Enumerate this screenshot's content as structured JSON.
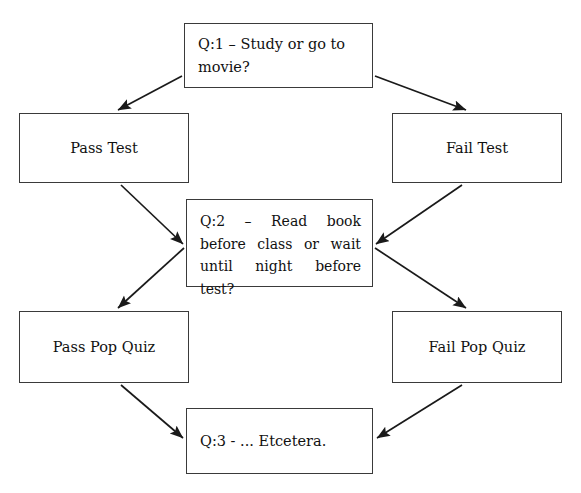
{
  "diagram": {
    "stroke_color": "#1a1a1a",
    "box_border_color": "#3a3a3a",
    "background_color": "#ffffff",
    "nodes": [
      {
        "id": "q1",
        "text": "Q:1 – Study or go to movie?"
      },
      {
        "id": "pass_test",
        "text": "Pass Test"
      },
      {
        "id": "fail_test",
        "text": "Fail Test"
      },
      {
        "id": "q2",
        "text": "Q:2 – Read book before class or wait until night before test?"
      },
      {
        "id": "pass_quiz",
        "text": "Pass Pop Quiz"
      },
      {
        "id": "fail_quiz",
        "text": "Fail Pop Quiz"
      },
      {
        "id": "q3",
        "text": "Q:3 - ...  Etcetera."
      }
    ],
    "edges": [
      {
        "from": "q1",
        "to": "pass_test",
        "label": ""
      },
      {
        "from": "q1",
        "to": "fail_test",
        "label": ""
      },
      {
        "from": "pass_test",
        "to": "q2",
        "label": ""
      },
      {
        "from": "fail_test",
        "to": "q2",
        "label": ""
      },
      {
        "from": "q2",
        "to": "pass_quiz",
        "label": ""
      },
      {
        "from": "q2",
        "to": "fail_quiz",
        "label": ""
      },
      {
        "from": "pass_quiz",
        "to": "q3",
        "label": ""
      },
      {
        "from": "fail_quiz",
        "to": "q3",
        "label": ""
      }
    ]
  }
}
